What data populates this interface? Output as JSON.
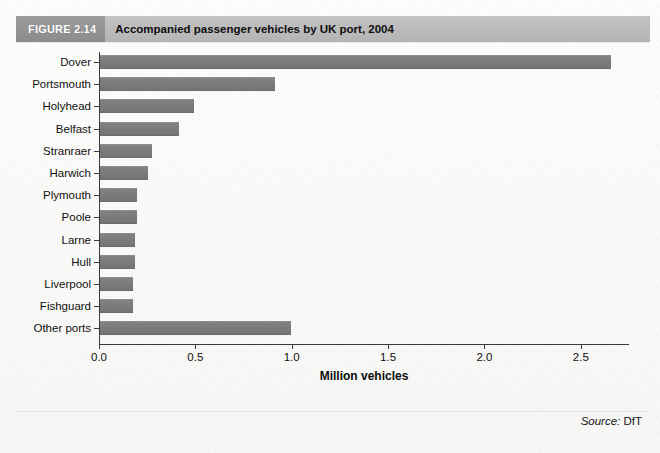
{
  "figure": {
    "number_label": "FIGURE 2.14",
    "title": "Accompanied passenger vehicles by UK port, 2004"
  },
  "source": {
    "label": "Source:",
    "value": "DfT"
  },
  "chart_data": {
    "type": "bar",
    "orientation": "horizontal",
    "title": "Accompanied passenger vehicles by UK port, 2004",
    "xlabel": "Million vehicles",
    "ylabel": "",
    "xlim": [
      0,
      2.75
    ],
    "xticks": [
      "0.0",
      "0.5",
      "1.0",
      "1.5",
      "2.0",
      "2.5"
    ],
    "xtick_values": [
      0,
      0.5,
      1.0,
      1.5,
      2.0,
      2.5
    ],
    "grid": false,
    "legend": "none",
    "bar_color": "#7c7c7c",
    "categories": [
      "Dover",
      "Portsmouth",
      "Holyhead",
      "Belfast",
      "Stranraer",
      "Harwich",
      "Plymouth",
      "Poole",
      "Larne",
      "Hull",
      "Liverpool",
      "Fishguard",
      "Other ports"
    ],
    "values": [
      2.65,
      0.91,
      0.49,
      0.41,
      0.27,
      0.25,
      0.19,
      0.19,
      0.18,
      0.18,
      0.17,
      0.17,
      0.99
    ]
  }
}
